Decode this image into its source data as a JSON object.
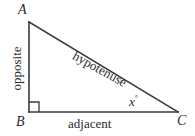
{
  "figure": {
    "background_color": "#ffffff",
    "stroke_color": "#3a3a3a",
    "text_color": "#2b2b2b"
  },
  "vertices": {
    "a": {
      "label": "A",
      "x": 29,
      "y": 22
    },
    "b": {
      "label": "B",
      "x": 29,
      "y": 112
    },
    "c": {
      "label": "C",
      "x": 178,
      "y": 112
    }
  },
  "sides": {
    "opposite": {
      "label": "opposite",
      "orientation": "vertical"
    },
    "hypotenuse": {
      "label": "hypotenuse",
      "orientation": "diagonal"
    },
    "adjacent": {
      "label": "adjacent",
      "orientation": "horizontal"
    }
  },
  "angle": {
    "variable": "x",
    "degree_symbol": "°",
    "at_vertex": "C"
  },
  "right_angle_marker": {
    "at_vertex": "B",
    "size": 10
  }
}
